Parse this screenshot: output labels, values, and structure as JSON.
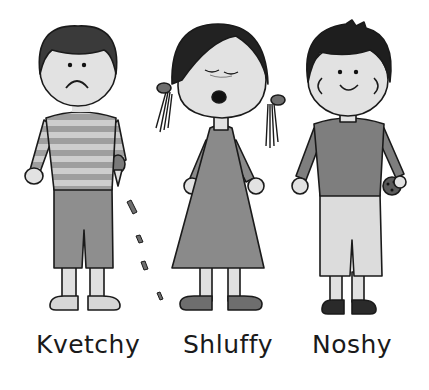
{
  "illustration": {
    "style": "grayscale cartoon",
    "background": "#ffffff",
    "characters": [
      {
        "name": "Kvetchy",
        "description": "boy with frown, striped shirt, crumbling cookie",
        "colors": {
          "hair": "#3a3a3a",
          "skin": "#e2e2e2",
          "shirt_light": "#c8c8c8",
          "shirt_dark": "#9a9a9a",
          "shorts": "#8e8e8e",
          "shoes": "#d8d8d8"
        }
      },
      {
        "name": "Shluffy",
        "description": "girl with pigtails, eyes closed, yawning, dress",
        "colors": {
          "hair": "#222222",
          "skin": "#e2e2e2",
          "dress": "#8a8a8a",
          "shoes": "#6e6e6e"
        }
      },
      {
        "name": "Noshy",
        "description": "smiling boy holding a cookie",
        "colors": {
          "hair": "#1e1e1e",
          "skin": "#e2e2e2",
          "shirt": "#7e7e7e",
          "shorts": "#dcdcdc",
          "shoes": "#2a2a2a"
        }
      }
    ]
  },
  "labels": {
    "kvetchy": "Kvetchy",
    "shluffy": "Shluffy",
    "noshy": "Noshy"
  }
}
